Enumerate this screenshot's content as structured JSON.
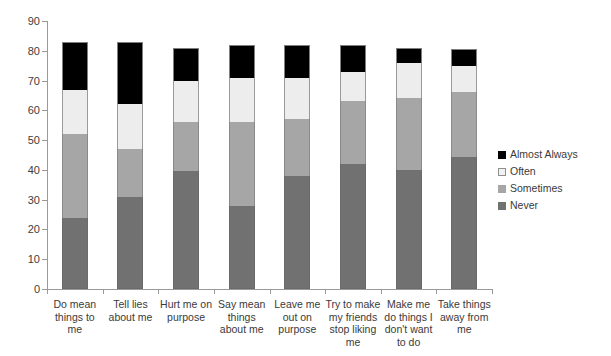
{
  "chart_data": {
    "type": "bar",
    "subtype": "stacked-vertical",
    "title": "",
    "xlabel": "",
    "ylabel": "",
    "ylim": [
      0,
      90
    ],
    "y_ticks": [
      0,
      10,
      20,
      30,
      40,
      50,
      60,
      70,
      80,
      90
    ],
    "grid": false,
    "legend_position": "right",
    "stack_order_bottom_to_top": [
      "Never",
      "Sometimes",
      "Often",
      "Almost Always"
    ],
    "categories": [
      "Do mean things to me",
      "Tell lies about me",
      "Hurt me on purpose",
      "Say mean things about me",
      "Leave me out on purpose",
      "Try to make my friends stop liking me",
      "Make me do things I don't want to do",
      "Take things away from me"
    ],
    "series": [
      {
        "name": "Never",
        "color": "#717171",
        "values": [
          24,
          31,
          39.5,
          28,
          38,
          42,
          40,
          44.5
        ]
      },
      {
        "name": "Sometimes",
        "color": "#a6a6a6",
        "values": [
          28,
          16,
          16.5,
          28,
          19,
          21,
          24,
          21.5
        ]
      },
      {
        "name": "Often",
        "color": "#ededed",
        "values": [
          15,
          15,
          14,
          15,
          14,
          10,
          12,
          9
        ]
      },
      {
        "name": "Almost Always",
        "color": "#000000",
        "values": [
          16,
          21,
          11,
          11,
          11,
          9,
          5,
          5.5
        ]
      }
    ],
    "totals": [
      83,
      83,
      81,
      82,
      82,
      82,
      81,
      80.5
    ]
  },
  "legend": {
    "items": [
      {
        "label": "Almost Always",
        "swatch": "almost-always-swatch"
      },
      {
        "label": "Often",
        "swatch": "often-swatch"
      },
      {
        "label": "Sometimes",
        "swatch": "sometimes-swatch"
      },
      {
        "label": "Never",
        "swatch": "never-swatch"
      }
    ]
  }
}
